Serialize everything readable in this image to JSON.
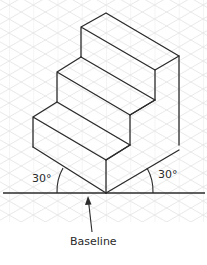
{
  "figure": {
    "colors": {
      "line": "#2b2b2b",
      "grid": "#dcdcdc",
      "background": "#ffffff"
    }
  },
  "labels": {
    "angle_left": "30°",
    "angle_right": "30°",
    "baseline": "Baseline"
  },
  "annotations": {
    "arrow_target": "baseline"
  }
}
